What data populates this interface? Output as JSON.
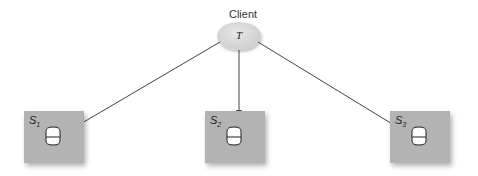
{
  "client": {
    "label": "Client",
    "node_text": "T"
  },
  "servers": [
    {
      "name": "S",
      "sub": "1"
    },
    {
      "name": "S",
      "sub": "2"
    },
    {
      "name": "S",
      "sub": "3"
    }
  ],
  "colors": {
    "server_fill": "#b3b3b3",
    "client_fill": "#d6d6d6",
    "edge": "#444444"
  }
}
